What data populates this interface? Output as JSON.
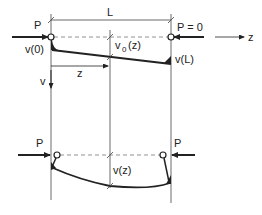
{
  "figure": {
    "top_panel": {
      "labels": {
        "load_left": "P",
        "length": "L",
        "load_right": "P = 0",
        "axis_z": "z",
        "deflection_left": "v(0)",
        "deflection_mid_base": "v",
        "deflection_mid_sub": "0",
        "deflection_mid_arg": "(z)",
        "deflection_right": "v(L)",
        "position_z": "z",
        "axis_v": "v"
      }
    },
    "bottom_panel": {
      "labels": {
        "load_left": "P",
        "load_right": "P",
        "deflection_mid": "v(z)"
      }
    },
    "colors": {
      "line": "#222222",
      "dashed": "#777777",
      "background": "#ffffff"
    }
  }
}
